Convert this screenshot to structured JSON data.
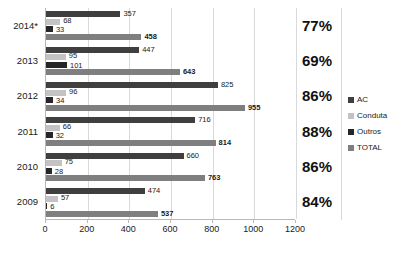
{
  "chart_data": {
    "type": "bar",
    "orientation": "horizontal",
    "title": "",
    "subtitle": "",
    "xlabel": "",
    "ylabel": "",
    "categories": [
      "2014*",
      "2013",
      "2012",
      "2011",
      "2010",
      "2009"
    ],
    "series": [
      {
        "name": "AC",
        "color": "#3f3f3f",
        "values": [
          357,
          447,
          825,
          716,
          660,
          474
        ]
      },
      {
        "name": "Conduta",
        "color": "#c3c3c3",
        "values": [
          68,
          95,
          96,
          66,
          75,
          57
        ]
      },
      {
        "name": "Outros",
        "color": "#262626",
        "values": [
          33,
          101,
          34,
          32,
          28,
          6
        ]
      },
      {
        "name": "TOTAL",
        "color": "#7f7f7f",
        "values": [
          458,
          643,
          955,
          814,
          763,
          537
        ]
      }
    ],
    "data_labels": {
      "2014*": {
        "AC": "357",
        "Conduta": "68",
        "Outros": "33",
        "TOTAL": "458"
      },
      "2013": {
        "AC": "447",
        "Conduta": "95",
        "Outros": "101",
        "TOTAL": "643"
      },
      "2012": {
        "AC": "825",
        "Conduta": "96",
        "Outros": "34",
        "TOTAL": "955"
      },
      "2011": {
        "AC": "716",
        "Conduta": "66",
        "Outros": "32",
        "TOTAL": "814"
      },
      "2010": {
        "AC": "660",
        "Conduta": "75",
        "Outros": "28",
        "TOTAL": "763"
      },
      "2009": {
        "AC": "474",
        "Conduta": "57",
        "Outros": "6",
        "TOTAL": "537"
      }
    },
    "xlim": [
      0,
      1200
    ],
    "xticks": [
      0,
      200,
      400,
      600,
      800,
      1000,
      1200
    ],
    "xtick_labels": [
      "0",
      "200",
      "400",
      "600",
      "800",
      "1000",
      "1200"
    ],
    "grid": true,
    "legend_position": "right",
    "legend": [
      "AC",
      "Conduta",
      "Outros",
      "TOTAL"
    ],
    "annotations": {
      "name": "percentage-column",
      "values": [
        "77%",
        "69%",
        "86%",
        "88%",
        "86%",
        "84%"
      ]
    }
  }
}
